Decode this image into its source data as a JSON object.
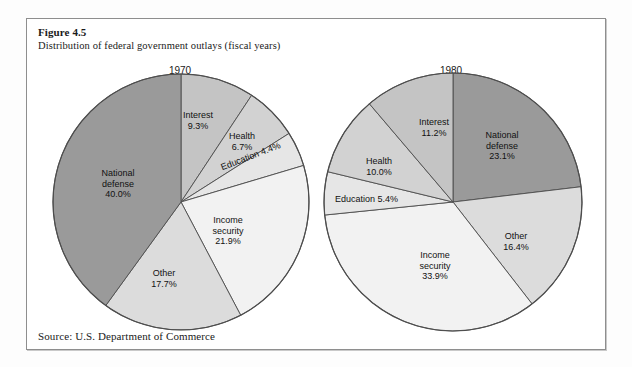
{
  "figure": {
    "number": "Figure 4.5",
    "subtitle": "Distribution of federal government outlays (fiscal years)",
    "source": "Source: U.S. Department of Commerce"
  },
  "palette": {
    "national_defense": "#9a9a9a",
    "other": "#dcdcdc",
    "income_security": "#f2f2f2",
    "education": "#e6e6e6",
    "health": "#d2d2d2",
    "interest": "#c4c4c4",
    "outline": "#4d4d4d",
    "frame": "#8e8e8e",
    "background": "#ffffff"
  },
  "chart_data": [
    {
      "type": "pie",
      "title": "1970",
      "categories": [
        "Interest",
        "Health",
        "Education",
        "Income security",
        "Other",
        "National defense"
      ],
      "values": [
        9.3,
        6.7,
        4.4,
        21.9,
        17.7,
        40.0
      ],
      "value_labels": [
        "9.3%",
        "6.7%",
        "4.4%",
        "21.9%",
        "17.7%",
        "40.0%"
      ],
      "unit": "%",
      "start_angle_deg": 0,
      "direction": "clockwise",
      "legend": "none",
      "grid": false,
      "slices": [
        {
          "label": "Interest",
          "value": 9.3,
          "value_label": "9.3%",
          "color": "#c4c4c4",
          "start_deg": 0.0,
          "end_deg": 33.5
        },
        {
          "label": "Health",
          "value": 6.7,
          "value_label": "6.7%",
          "color": "#d2d2d2",
          "start_deg": 33.5,
          "end_deg": 57.6
        },
        {
          "label": "Education",
          "value": 4.4,
          "value_label": "4.4%",
          "color": "#e6e6e6",
          "start_deg": 57.6,
          "end_deg": 73.4
        },
        {
          "label": "Income security",
          "value": 21.9,
          "value_label": "21.9%",
          "color": "#f2f2f2",
          "start_deg": 73.4,
          "end_deg": 152.2
        },
        {
          "label": "Other",
          "value": 17.7,
          "value_label": "17.7%",
          "color": "#dcdcdc",
          "start_deg": 152.2,
          "end_deg": 216.0
        },
        {
          "label": "National defense",
          "value": 40.0,
          "value_label": "40.0%",
          "color": "#9a9a9a",
          "start_deg": 216.0,
          "end_deg": 360.0
        }
      ]
    },
    {
      "type": "pie",
      "title": "1980",
      "categories": [
        "National defense",
        "Other",
        "Income security",
        "Education",
        "Health",
        "Interest"
      ],
      "values": [
        23.1,
        16.4,
        33.9,
        5.4,
        10.0,
        11.2
      ],
      "value_labels": [
        "23.1%",
        "16.4%",
        "33.9%",
        "5.4%",
        "10.0%",
        "11.2%"
      ],
      "unit": "%",
      "start_angle_deg": 0,
      "direction": "clockwise",
      "legend": "none",
      "grid": false,
      "slices": [
        {
          "label": "National defense",
          "value": 23.1,
          "value_label": "23.1%",
          "color": "#9a9a9a",
          "start_deg": 0.0,
          "end_deg": 83.2
        },
        {
          "label": "Other",
          "value": 16.4,
          "value_label": "16.4%",
          "color": "#dcdcdc",
          "start_deg": 83.2,
          "end_deg": 142.2
        },
        {
          "label": "Income security",
          "value": 33.9,
          "value_label": "33.9%",
          "color": "#f2f2f2",
          "start_deg": 142.2,
          "end_deg": 264.2
        },
        {
          "label": "Education",
          "value": 5.4,
          "value_label": "5.4%",
          "color": "#e6e6e6",
          "start_deg": 264.2,
          "end_deg": 283.6
        },
        {
          "label": "Health",
          "value": 10.0,
          "value_label": "10.0%",
          "color": "#d2d2d2",
          "start_deg": 283.6,
          "end_deg": 319.6
        },
        {
          "label": "Interest",
          "value": 11.2,
          "value_label": "11.2%",
          "color": "#c4c4c4",
          "start_deg": 319.6,
          "end_deg": 360.0
        }
      ]
    }
  ],
  "labels_1970": {
    "interest": "Interest\n9.3%",
    "health": "Health\n6.7%",
    "education": "Education 4.4%",
    "income_security": "Income\nsecurity\n21.9%",
    "other": "Other\n17.7%",
    "national_defense": "National\ndefense\n40.0%"
  },
  "labels_1980": {
    "national_defense": "National\ndefense\n23.1%",
    "other": "Other\n16.4%",
    "income_security": "Income\nsecurity\n33.9%",
    "education": "Education 5.4%",
    "health": "Health\n10.0%",
    "interest": "Interest\n11.2%"
  }
}
